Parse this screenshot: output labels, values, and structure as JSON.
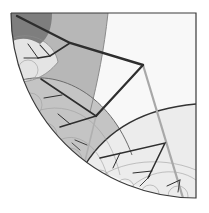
{
  "diagram": {
    "type": "hyperbolic-tree-poincare-quarter-disk",
    "disk": {
      "cx": 196,
      "cy": 13,
      "r": 185
    },
    "colors": {
      "background": "#ffffff",
      "disk_base": "#f7f7f7",
      "region_darkest": "#7c7c7c",
      "region_dark": "#b4b4b4",
      "region_mid": "#c6c6c6",
      "region_light": "#e6e6e6",
      "region_lightest": "#eeeeee",
      "edge_dark": "#2e2e2e",
      "edge_light": "#a8a8a8",
      "geodesic": "#555555",
      "faint_geodesic": "#9a9a9a",
      "frame": "#3a3a3a"
    },
    "nodes": [
      {
        "id": "root",
        "x": 17,
        "y": 16
      },
      {
        "id": "n1",
        "x": 70,
        "y": 43
      },
      {
        "id": "n2",
        "x": 143,
        "y": 65
      },
      {
        "id": "n3",
        "x": 96,
        "y": 116
      },
      {
        "id": "n4",
        "x": 165,
        "y": 143
      },
      {
        "id": "n5",
        "x": 38,
        "y": 58
      }
    ]
  }
}
